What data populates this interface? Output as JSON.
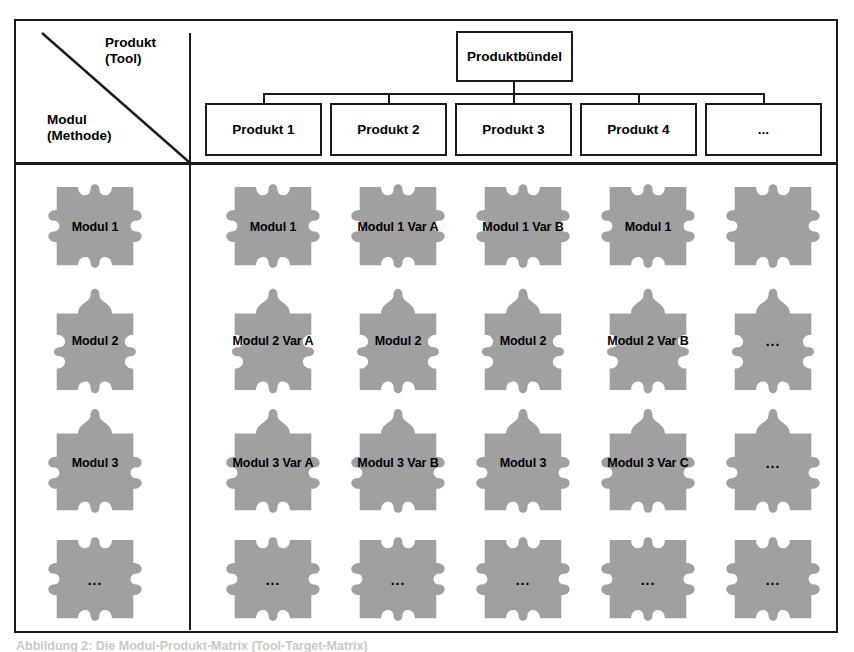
{
  "figure": {
    "axis_labels": {
      "columns_label": "Produkt\n(Tool)",
      "rows_label": "Modul\n(Methode)"
    },
    "caption": "Abbildung 2: Die Modul-Produkt-Matrix (Tool-Target-Matrix)",
    "colors": {
      "piece_fill": "#a0a0a0",
      "line": "#1a1a1a",
      "background": "#ffffff",
      "text": "#000000"
    }
  },
  "tree": {
    "root": {
      "label": "Produktbündel"
    },
    "children": [
      {
        "label": "Produkt 1"
      },
      {
        "label": "Produkt 2"
      },
      {
        "label": "Produkt 3"
      },
      {
        "label": "Produkt 4"
      },
      {
        "label": "..."
      }
    ]
  },
  "matrix": {
    "row_header_column_title": "Modul (Methode)",
    "column_headers": [
      "Produkt 1",
      "Produkt 2",
      "Produkt 3",
      "Produkt 4",
      "..."
    ],
    "row_headers": [
      "Modul 1",
      "Modul 2",
      "Modul 3",
      "..."
    ],
    "rows": [
      {
        "header": "Modul 1",
        "shape": "knob-left-right-notch-top-bottom",
        "cells": [
          "Modul 1",
          "Modul 1 Var A",
          "Modul 1 Var B",
          "Modul 1",
          ""
        ]
      },
      {
        "header": "Modul 2",
        "shape": "knob-top-bottom-notch-left-right",
        "cells": [
          "Modul 2 Var A",
          "Modul 2",
          "Modul 2",
          "Modul 2 Var B",
          "..."
        ]
      },
      {
        "header": "Modul 3",
        "shape": "knob-top-left-right-notch-bottom",
        "cells": [
          "Modul 3 Var A",
          "Modul 3 Var B",
          "Modul 3",
          "Modul 3 Var C",
          "..."
        ]
      },
      {
        "header": "...",
        "shape": "knob-left-right-notch-top-bottom",
        "cells": [
          "...",
          "...",
          "...",
          "...",
          "..."
        ]
      }
    ]
  }
}
